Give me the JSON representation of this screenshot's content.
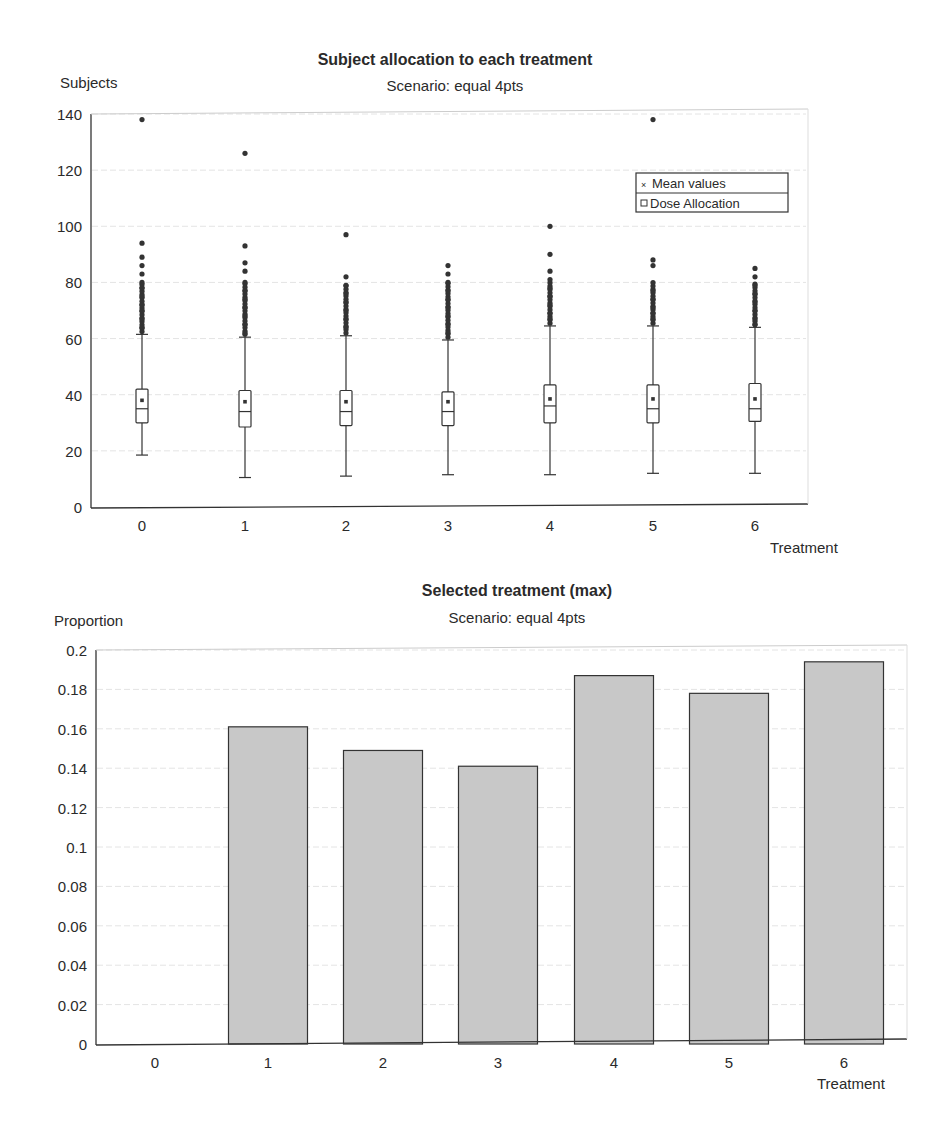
{
  "chart_data": [
    {
      "type": "box",
      "title": "Subject allocation to each treatment",
      "subtitle": "Scenario: equal 4pts",
      "xlabel": "Treatment",
      "ylabel": "Subjects",
      "categories": [
        "0",
        "1",
        "2",
        "3",
        "4",
        "5",
        "6"
      ],
      "ylim": [
        0,
        140
      ],
      "yticks": [
        0,
        20,
        40,
        60,
        80,
        100,
        120,
        140
      ],
      "grid": true,
      "legend": {
        "position": "upper right",
        "entries": [
          {
            "symbol": "x-marker",
            "label": "Mean values"
          },
          {
            "symbol": "square",
            "label": "Dose Allocation"
          }
        ]
      },
      "boxes": [
        {
          "treatment": "0",
          "min": 18.5,
          "q1": 30,
          "median": 35,
          "q3": 42,
          "whisker_high": 61.5,
          "mean": 38,
          "outliers_max": 138,
          "outliers": [
            138,
            94,
            89,
            86,
            83,
            80,
            78,
            75,
            72,
            70,
            67,
            64
          ]
        },
        {
          "treatment": "1",
          "min": 10.5,
          "q1": 28.5,
          "median": 34,
          "q3": 41.5,
          "whisker_high": 60.5,
          "mean": 37.5,
          "outliers_max": 126,
          "outliers": [
            126,
            93,
            87,
            84,
            80,
            77,
            74,
            71,
            68,
            65,
            62
          ]
        },
        {
          "treatment": "2",
          "min": 11,
          "q1": 29,
          "median": 34,
          "q3": 41.5,
          "whisker_high": 61,
          "mean": 37.5,
          "outliers_max": 97,
          "outliers": [
            97,
            82,
            79,
            76,
            73,
            70,
            67,
            64
          ]
        },
        {
          "treatment": "3",
          "min": 11.5,
          "q1": 29,
          "median": 34,
          "q3": 41,
          "whisker_high": 59.5,
          "mean": 37.5,
          "outliers_max": 86,
          "outliers": [
            86,
            83,
            80,
            77,
            74,
            71,
            68,
            65,
            62
          ]
        },
        {
          "treatment": "4",
          "min": 11.5,
          "q1": 30,
          "median": 36,
          "q3": 43.5,
          "whisker_high": 64.5,
          "mean": 38.5,
          "outliers_max": 100,
          "outliers": [
            100,
            90,
            84,
            81,
            78,
            75,
            72,
            69,
            67
          ]
        },
        {
          "treatment": "5",
          "min": 12,
          "q1": 30,
          "median": 35,
          "q3": 43.5,
          "whisker_high": 64.5,
          "mean": 38.5,
          "outliers_max": 138,
          "outliers": [
            138,
            88,
            86,
            77,
            74,
            71,
            69,
            67
          ]
        },
        {
          "treatment": "6",
          "min": 12,
          "q1": 30.5,
          "median": 35,
          "q3": 44,
          "whisker_high": 64,
          "mean": 38.5,
          "outliers_max": 85,
          "outliers": [
            85,
            82,
            79,
            76,
            73,
            70,
            67,
            65
          ]
        }
      ]
    },
    {
      "type": "bar",
      "title": "Selected treatment (max)",
      "subtitle": "Scenario: equal 4pts",
      "xlabel": "Treatment",
      "ylabel": "Proportion",
      "categories": [
        "0",
        "1",
        "2",
        "3",
        "4",
        "5",
        "6"
      ],
      "values": [
        0,
        0.161,
        0.149,
        0.141,
        0.187,
        0.178,
        0.194
      ],
      "ylim": [
        0,
        0.2
      ],
      "yticks": [
        "0",
        "0.02",
        "0.04",
        "0.06",
        "0.08",
        "0.1",
        "0.12",
        "0.14",
        "0.16",
        "0.18",
        "0.2"
      ],
      "grid": true,
      "bar_color": "#c8c8c8"
    }
  ],
  "top": {
    "title": "Subject allocation to each treatment",
    "subtitle": "Scenario: equal 4pts",
    "ylabel": "Subjects",
    "xlabel": "Treatment",
    "legend_mean": "Mean values",
    "legend_box": "Dose Allocation"
  },
  "bottom": {
    "title": "Selected treatment (max)",
    "subtitle": "Scenario: equal 4pts",
    "ylabel": "Proportion",
    "xlabel": "Treatment"
  }
}
